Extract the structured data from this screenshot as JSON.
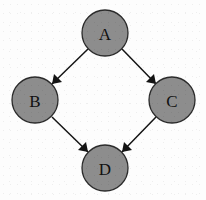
{
  "figure": {
    "kind": "directed-acyclic-graph",
    "background_color": "#fdfdfd",
    "node_fill_color": "#8d8d8d",
    "node_stroke_color": "#2b2b2b",
    "edge_color": "#141414",
    "label_color": "#111111",
    "node_radius": 23
  },
  "nodes": [
    {
      "id": "A",
      "label": "A",
      "cx": 105,
      "cy": 33,
      "r": 23
    },
    {
      "id": "B",
      "label": "B",
      "cx": 35,
      "cy": 100,
      "r": 23
    },
    {
      "id": "C",
      "label": "C",
      "cx": 172,
      "cy": 100,
      "r": 23
    },
    {
      "id": "D",
      "label": "D",
      "cx": 105,
      "cy": 168,
      "r": 23
    }
  ],
  "edges": [
    {
      "id": "A-B",
      "from": "A",
      "to": "B",
      "directed": true,
      "x1": 88,
      "y1": 49,
      "x2": 52,
      "y2": 84,
      "head": "52,84 62,82 54,74"
    },
    {
      "id": "A-C",
      "from": "A",
      "to": "C",
      "directed": true,
      "x1": 122,
      "y1": 49,
      "x2": 156,
      "y2": 84,
      "head": "156,84 146,82 154,74"
    },
    {
      "id": "B-D",
      "from": "B",
      "to": "D",
      "directed": true,
      "x1": 52,
      "y1": 117,
      "x2": 88,
      "y2": 152,
      "head": "88,152 78,150 86,142"
    },
    {
      "id": "C-D",
      "from": "C",
      "to": "D",
      "directed": true,
      "x1": 156,
      "y1": 117,
      "x2": 122,
      "y2": 152,
      "head": "122,152 132,150 124,142"
    }
  ]
}
